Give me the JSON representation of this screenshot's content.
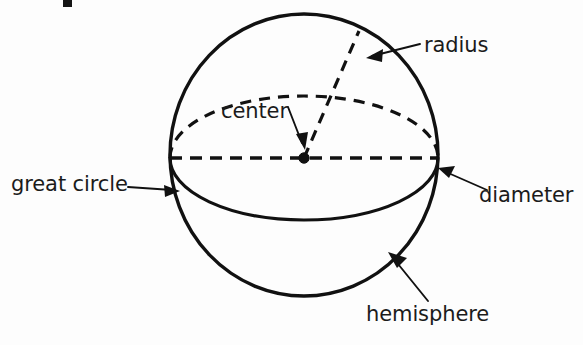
{
  "figure": {
    "background_color": "#fdfdfd",
    "ink_color": "#111111",
    "labels": {
      "radius": "radius",
      "center": "center",
      "great_circle": "great circle",
      "diameter": "diameter",
      "hemisphere": "hemisphere"
    },
    "geometry": {
      "sphere_center_x": 304,
      "sphere_center_y": 158,
      "sphere_radius_x": 134,
      "sphere_radius_y": 141,
      "equator_semi_minor": 62,
      "radius_endpoint_x": 360,
      "radius_endpoint_y": 33
    },
    "parts": [
      "sphere-outline",
      "great-circle-ellipse",
      "diameter-dashed-line",
      "radius-dashed-line",
      "center-dot"
    ]
  }
}
